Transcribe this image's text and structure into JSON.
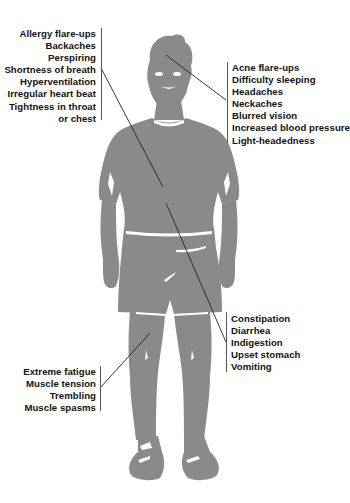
{
  "diagram": {
    "figure_color": "#8a8a8a",
    "leader_color": "#222222",
    "groups": [
      {
        "id": "chest",
        "side": "left",
        "labels": [
          "Allergy flare-ups",
          "Backaches",
          "Perspiring",
          "Shortness of breath",
          "Hyperventilation",
          "Irregular heart beat",
          "Tightness in throat",
          "or chest"
        ]
      },
      {
        "id": "head",
        "side": "right",
        "labels": [
          "Acne flare-ups",
          "Difficulty sleeping",
          "Headaches",
          "Neckaches",
          "Blurred vision",
          "Increased blood pressure",
          "Light-headedness"
        ]
      },
      {
        "id": "stomach",
        "side": "right",
        "labels": [
          "Constipation",
          "Diarrhea",
          "Indigestion",
          "Upset stomach",
          "Vomiting"
        ]
      },
      {
        "id": "legs",
        "side": "left",
        "labels": [
          "Extreme fatigue",
          "Muscle tension",
          "Trembling",
          "Muscle spasms"
        ]
      }
    ]
  }
}
